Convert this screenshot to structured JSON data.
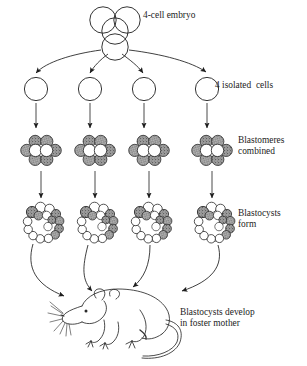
{
  "figure": {
    "background_color": "#ffffff",
    "ink_color": "#1d1d1d",
    "shade_color": "#8d8d8d"
  },
  "labels": {
    "embryo": "4-cell embryo",
    "isolated_cells": "4 isolated  cells",
    "blastomeres": "Blastomeres\ncombined",
    "blastocysts": "Blastocysts\nform",
    "foster": "Blastocysts develop\nin foster mother"
  },
  "stages": [
    {
      "name": "four-cell-embryo",
      "row": 1,
      "count": 1,
      "description": "four overlapping circles in tetrahedral cluster"
    },
    {
      "name": "isolated-cells",
      "row": 2,
      "count": 4,
      "description": "four separate empty circles"
    },
    {
      "name": "blastomere-clusters",
      "row": 3,
      "count": 4,
      "description": "eight-cell rosette, stippled outer cells around two white inner cells"
    },
    {
      "name": "blastocysts",
      "row": 4,
      "count": 4,
      "description": "hollow sphere ringed with cells and inner cell mass"
    },
    {
      "name": "foster-mouse",
      "row": 5,
      "count": 1,
      "description": "line drawing of mouse facing left"
    }
  ],
  "arrows": {
    "embryo_to_cells": {
      "count": 4,
      "style": "curved-splayed"
    },
    "cells_to_blastomeres": {
      "count": 4,
      "style": "straight-vertical"
    },
    "blastomeres_to_blastocysts": {
      "count": 4,
      "style": "straight-vertical"
    },
    "blastocysts_to_mouse": {
      "count": 4,
      "style": "curved-converging"
    }
  },
  "columns_x": [
    36,
    90,
    144,
    207
  ]
}
